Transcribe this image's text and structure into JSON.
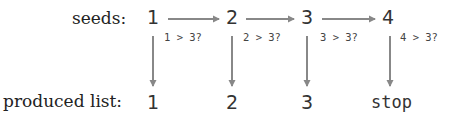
{
  "rows": {
    "seeds_label": "seeds:",
    "produced_label": "produced list:"
  },
  "seeds": [
    "1",
    "2",
    "3",
    "4"
  ],
  "conditions": [
    "1 > 3?",
    "2 > 3?",
    "3 > 3?",
    "4 > 3?"
  ],
  "produced": [
    "1",
    "2",
    "3",
    "stop"
  ],
  "colors": {
    "arrow": "#888888",
    "text": "#333333"
  }
}
